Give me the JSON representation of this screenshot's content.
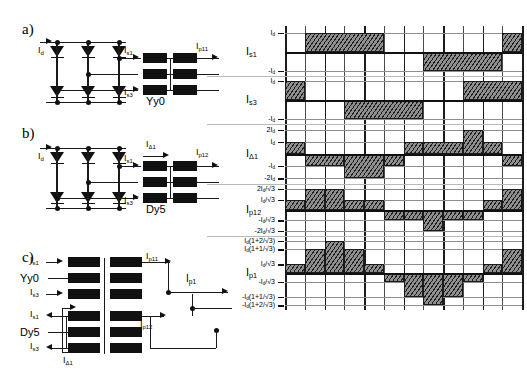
{
  "figure": {
    "panels": [
      "a)",
      "b)",
      "c)"
    ]
  },
  "panel_a": {
    "letter": "a)",
    "transformer": "Yy0",
    "labels": {
      "input_current": "I",
      "input_current_sub": "d",
      "sec1": "I",
      "sec1_sub": "s1",
      "sec3": "I",
      "sec3_sub": "s3",
      "prim": "I",
      "prim_sub": "p11"
    }
  },
  "panel_b": {
    "letter": "b)",
    "transformer": "Dy5",
    "labels": {
      "input_current": "I",
      "input_current_sub": "d",
      "sec1": "I",
      "sec1_sub": "s1",
      "sec3": "I",
      "sec3_sub": "s3",
      "delta": "I",
      "delta_sub": "Δ1",
      "prim": "I",
      "prim_sub": "p12"
    }
  },
  "panel_c": {
    "letter": "c)",
    "group_top": "Yy0",
    "group_bottom": "Dy5",
    "labels": {
      "s1_top": "I",
      "s1_top_sub": "s1",
      "s3_top": "I",
      "s3_top_sub": "s3",
      "s1_bot": "I",
      "s1_bot_sub": "s1",
      "s3_bot": "I",
      "s3_bot_sub": "s3",
      "p11": "I",
      "p11_sub": "p11",
      "p12": "I",
      "p12_sub": "p12",
      "p1": "I",
      "p1_sub": "p1",
      "delta": "I",
      "delta_sub": "Δ1"
    }
  },
  "chart_data": {
    "type": "line",
    "xlabel": "",
    "ylabel": "",
    "grid": true,
    "legend": "none",
    "x": [
      0,
      30,
      60,
      90,
      120,
      150,
      180,
      210,
      240,
      270,
      300,
      330,
      360
    ],
    "xlim": [
      0,
      360
    ],
    "traces": [
      {
        "name": "I",
        "name_sub": "s1",
        "ylim": [
          -1.15,
          1.15
        ],
        "ticks": [
          {
            "value": 1,
            "label": "I",
            "label_sub": "d"
          },
          {
            "value": -1,
            "label": "-I",
            "label_sub": "d"
          }
        ],
        "waveform_type": "quasi-square",
        "steps": [
          {
            "from": 0,
            "to": 30,
            "value": 0
          },
          {
            "from": 30,
            "to": 150,
            "value": 1
          },
          {
            "from": 150,
            "to": 210,
            "value": 0
          },
          {
            "from": 210,
            "to": 330,
            "value": -1
          },
          {
            "from": 330,
            "to": 360,
            "value": 1
          }
        ]
      },
      {
        "name": "I",
        "name_sub": "s3",
        "ylim": [
          -1.15,
          1.15
        ],
        "ticks": [
          {
            "value": 1,
            "label": "I",
            "label_sub": "d"
          },
          {
            "value": -1,
            "label": "-I",
            "label_sub": "d"
          }
        ],
        "waveform_type": "quasi-square",
        "steps": [
          {
            "from": 0,
            "to": 30,
            "value": 1
          },
          {
            "from": 30,
            "to": 90,
            "value": 0
          },
          {
            "from": 90,
            "to": 210,
            "value": -1
          },
          {
            "from": 210,
            "to": 270,
            "value": 0
          },
          {
            "from": 270,
            "to": 360,
            "value": 1
          }
        ]
      },
      {
        "name": "I",
        "name_sub": "Δ1",
        "ylim": [
          -2.3,
          2.3
        ],
        "ticks": [
          {
            "value": 2,
            "label": "2I",
            "label_sub": "d"
          },
          {
            "value": 1,
            "label": "I",
            "label_sub": "d"
          },
          {
            "value": -1,
            "label": "-I",
            "label_sub": "d"
          },
          {
            "value": -2,
            "label": "-2I",
            "label_sub": "d"
          }
        ],
        "waveform_type": "six-step",
        "steps": [
          {
            "from": 0,
            "to": 30,
            "value": 1
          },
          {
            "from": 30,
            "to": 90,
            "value": -1
          },
          {
            "from": 90,
            "to": 150,
            "value": -2
          },
          {
            "from": 150,
            "to": 180,
            "value": -1
          },
          {
            "from": 180,
            "to": 210,
            "value": 1
          },
          {
            "from": 210,
            "to": 270,
            "value": 1
          },
          {
            "from": 270,
            "to": 300,
            "value": 2
          },
          {
            "from": 300,
            "to": 330,
            "value": 1
          },
          {
            "from": 330,
            "to": 360,
            "value": -1
          }
        ]
      },
      {
        "name": "I",
        "name_sub": "p12",
        "ylim": [
          -1.32,
          1.32
        ],
        "ticks": [
          {
            "value": 1.1547,
            "label": "2I",
            "label_sub": "d",
            "label_post": "/√3"
          },
          {
            "value": 0.5774,
            "label": "I",
            "label_sub": "d",
            "label_post": "/√3"
          },
          {
            "value": -0.5774,
            "label": "-I",
            "label_sub": "d",
            "label_post": "/√3"
          },
          {
            "value": -1.1547,
            "label": "-2I",
            "label_sub": "d",
            "label_post": "/√3"
          }
        ],
        "waveform_type": "staircase",
        "steps": [
          {
            "from": 0,
            "to": 30,
            "value": 0.5774
          },
          {
            "from": 30,
            "to": 60,
            "value": 1.1547
          },
          {
            "from": 60,
            "to": 90,
            "value": 1.1547
          },
          {
            "from": 90,
            "to": 120,
            "value": 0.5774
          },
          {
            "from": 120,
            "to": 150,
            "value": 0.5774
          },
          {
            "from": 150,
            "to": 180,
            "value": -0.5774
          },
          {
            "from": 180,
            "to": 210,
            "value": -0.5774
          },
          {
            "from": 210,
            "to": 240,
            "value": -1.1547
          },
          {
            "from": 240,
            "to": 270,
            "value": -0.5774
          },
          {
            "from": 270,
            "to": 300,
            "value": -0.5774
          },
          {
            "from": 300,
            "to": 330,
            "value": 0.5774
          },
          {
            "from": 330,
            "to": 360,
            "value": 1.1547
          }
        ]
      },
      {
        "name": "I",
        "name_sub": "p1",
        "ylim": [
          -2.2,
          2.2
        ],
        "ticks": [
          {
            "value": 2.1547,
            "label": "I",
            "label_sub": "d",
            "label_post": "(1+2/√3)"
          },
          {
            "value": 1.5774,
            "label": "I",
            "label_sub": "d",
            "label_post": "(1+1/√3)"
          },
          {
            "value": 0.5774,
            "label": "I",
            "label_sub": "d",
            "label_post": "/√3"
          },
          {
            "value": -0.5774,
            "label": "-I",
            "label_sub": "d",
            "label_post": "/√3"
          },
          {
            "value": -1.5774,
            "label": "-I",
            "label_sub": "d",
            "label_post": "(1+1/√3)"
          },
          {
            "value": -2.1547,
            "label": "-I",
            "label_sub": "d",
            "label_post": "(1+2/√3)"
          }
        ],
        "waveform_type": "twelve-step",
        "steps": [
          {
            "from": 0,
            "to": 30,
            "value": 0.5774
          },
          {
            "from": 30,
            "to": 60,
            "value": 1.5774
          },
          {
            "from": 60,
            "to": 90,
            "value": 2.1547
          },
          {
            "from": 90,
            "to": 120,
            "value": 1.5774
          },
          {
            "from": 120,
            "to": 150,
            "value": 0.5774
          },
          {
            "from": 150,
            "to": 180,
            "value": -0.5774
          },
          {
            "from": 180,
            "to": 210,
            "value": -1.5774
          },
          {
            "from": 210,
            "to": 240,
            "value": -2.1547
          },
          {
            "from": 240,
            "to": 270,
            "value": -1.5774
          },
          {
            "from": 270,
            "to": 300,
            "value": -0.5774
          },
          {
            "from": 300,
            "to": 330,
            "value": 0.5774
          },
          {
            "from": 330,
            "to": 360,
            "value": 1.5774
          }
        ]
      }
    ]
  }
}
